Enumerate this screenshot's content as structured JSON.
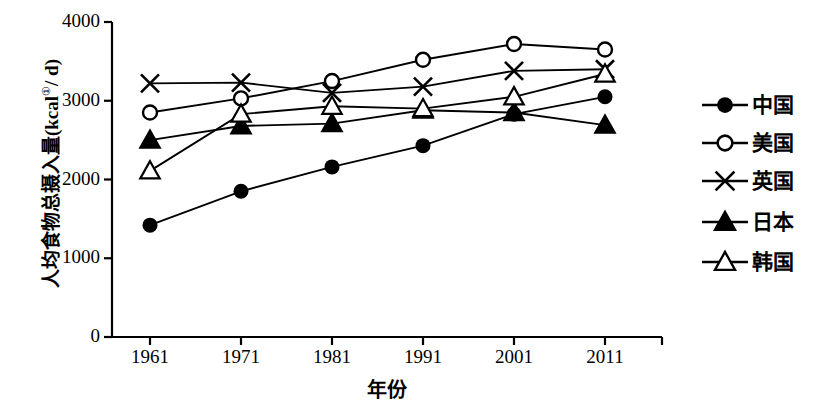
{
  "chart_data": {
    "type": "line",
    "title": "",
    "xlabel": "年份",
    "ylabel": "人均食物总摄入量(kcal①/ d)",
    "ylabel_unit_superscript": "①",
    "categories": [
      "1961",
      "1971",
      "1981",
      "1991",
      "2001",
      "2011"
    ],
    "x": [
      1961,
      1971,
      1981,
      1991,
      2001,
      2011
    ],
    "ylim": [
      0,
      4000
    ],
    "ytick_labels": [
      "0",
      "1000",
      "2000",
      "3000",
      "4000"
    ],
    "ytick_values": [
      0,
      1000,
      2000,
      3000,
      4000
    ],
    "grid": false,
    "legend_position": "right",
    "series": [
      {
        "name": "中国",
        "marker": "filled-circle",
        "color": "#000000",
        "values": [
          1420,
          1850,
          2160,
          2430,
          2830,
          3050
        ]
      },
      {
        "name": "美国",
        "marker": "open-circle",
        "color": "#000000",
        "values": [
          2850,
          3030,
          3250,
          3520,
          3720,
          3650
        ]
      },
      {
        "name": "英国",
        "marker": "cross-x",
        "color": "#000000",
        "values": [
          3220,
          3230,
          3100,
          3180,
          3380,
          3400
        ]
      },
      {
        "name": "日本",
        "marker": "filled-triangle",
        "color": "#000000",
        "values": [
          2500,
          2680,
          2710,
          2880,
          2850,
          2690
        ]
      },
      {
        "name": "韩国",
        "marker": "open-triangle",
        "color": "#000000",
        "values": [
          2110,
          2830,
          2930,
          2900,
          3050,
          3340
        ]
      }
    ]
  },
  "axis": {
    "y_axis_name": "y-axis",
    "x_axis_name": "x-axis"
  },
  "legend": {
    "items": [
      {
        "label": "中国",
        "marker": "filled-circle"
      },
      {
        "label": "美国",
        "marker": "open-circle"
      },
      {
        "label": "英国",
        "marker": "cross-x"
      },
      {
        "label": "日本",
        "marker": "filled-triangle"
      },
      {
        "label": "韩国",
        "marker": "open-triangle"
      }
    ]
  }
}
